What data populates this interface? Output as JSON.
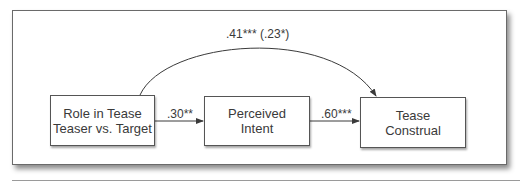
{
  "diagram": {
    "type": "mediation-path-diagram",
    "nodes": [
      {
        "id": "role",
        "line1": "Role in Tease",
        "line2": "Teaser vs. Target"
      },
      {
        "id": "intent",
        "line1": "Perceived",
        "line2": "Intent"
      },
      {
        "id": "construal",
        "line1": "Tease",
        "line2": "Construal"
      }
    ],
    "edges": [
      {
        "from": "role",
        "to": "intent",
        "label": ".30**"
      },
      {
        "from": "intent",
        "to": "construal",
        "label": ".60***"
      },
      {
        "from": "role",
        "to": "construal",
        "label": ".41*** (.23*)",
        "curved": true
      }
    ],
    "colors": {
      "line": "#3a3a3a",
      "text": "#3a3a3a",
      "border": "#555555"
    }
  }
}
